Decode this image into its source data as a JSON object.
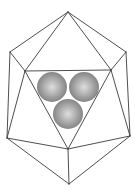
{
  "diagram": {
    "width": 135,
    "height": 191,
    "colors": {
      "background": "#ffffff",
      "edge": "#3a3a3a",
      "sphere_highlight": "#d8d8d8",
      "sphere_mid": "#a6a6a6",
      "sphere_shadow": "#7a7a7a"
    },
    "vertices": {
      "top": [
        68,
        12
      ],
      "upper_left": [
        10,
        52
      ],
      "upper_right": [
        126,
        52
      ],
      "tri_left": [
        25,
        71
      ],
      "tri_right": [
        111,
        70
      ],
      "tri_bottom": [
        68,
        149
      ],
      "lower_left": [
        7,
        138
      ],
      "lower_right": [
        130,
        136
      ],
      "bottom": [
        69,
        184
      ]
    },
    "edges": [
      [
        "top",
        "upper_left"
      ],
      [
        "top",
        "upper_right"
      ],
      [
        "top",
        "tri_left"
      ],
      [
        "top",
        "tri_right"
      ],
      [
        "upper_left",
        "tri_left"
      ],
      [
        "upper_right",
        "tri_right"
      ],
      [
        "tri_left",
        "tri_right"
      ],
      [
        "tri_left",
        "tri_bottom"
      ],
      [
        "tri_right",
        "tri_bottom"
      ],
      [
        "upper_left",
        "lower_left"
      ],
      [
        "upper_right",
        "lower_right"
      ],
      [
        "tri_left",
        "lower_left"
      ],
      [
        "tri_right",
        "lower_right"
      ],
      [
        "lower_left",
        "tri_bottom"
      ],
      [
        "lower_right",
        "tri_bottom"
      ],
      [
        "lower_left",
        "bottom"
      ],
      [
        "lower_right",
        "bottom"
      ],
      [
        "tri_bottom",
        "bottom"
      ]
    ],
    "spheres": [
      {
        "name": "sphere-left",
        "cx": 52,
        "cy": 87,
        "r": 15
      },
      {
        "name": "sphere-right",
        "cx": 84,
        "cy": 87,
        "r": 15
      },
      {
        "name": "sphere-bottom",
        "cx": 68,
        "cy": 114,
        "r": 15
      }
    ]
  }
}
